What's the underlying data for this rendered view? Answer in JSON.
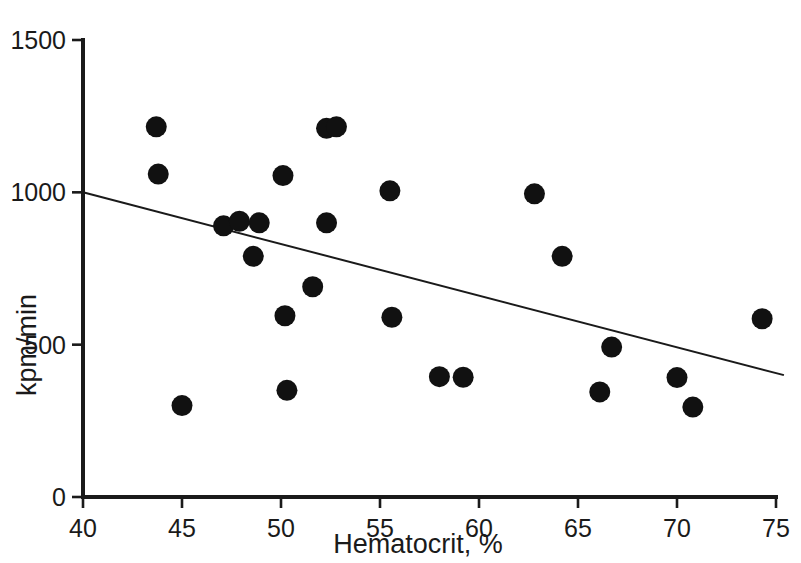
{
  "chart_data": {
    "type": "scatter",
    "title": "",
    "xlabel": "Hematocrit, %",
    "ylabel": "kpm/min",
    "xlim": [
      40,
      75
    ],
    "ylim": [
      0,
      1500
    ],
    "xticks": [
      40,
      45,
      50,
      55,
      60,
      65,
      70,
      75
    ],
    "xtick_labels": [
      "40",
      "45",
      "50",
      "55",
      "60",
      "65",
      "70",
      "75"
    ],
    "yticks": [
      0,
      500,
      1000,
      1500
    ],
    "ytick_labels": [
      "0",
      "500",
      "1000",
      "1500"
    ],
    "grid": false,
    "legend": null,
    "marker": "filled-circle",
    "marker_color": "#111111",
    "points": [
      {
        "x": 43.7,
        "y": 1215
      },
      {
        "x": 43.8,
        "y": 1060
      },
      {
        "x": 45.0,
        "y": 300
      },
      {
        "x": 47.1,
        "y": 890
      },
      {
        "x": 47.9,
        "y": 905
      },
      {
        "x": 48.6,
        "y": 790
      },
      {
        "x": 48.9,
        "y": 900
      },
      {
        "x": 50.1,
        "y": 1055
      },
      {
        "x": 50.2,
        "y": 595
      },
      {
        "x": 50.3,
        "y": 350
      },
      {
        "x": 51.6,
        "y": 690
      },
      {
        "x": 52.3,
        "y": 1210
      },
      {
        "x": 52.8,
        "y": 1215
      },
      {
        "x": 52.3,
        "y": 900
      },
      {
        "x": 55.5,
        "y": 1005
      },
      {
        "x": 55.6,
        "y": 590
      },
      {
        "x": 58.0,
        "y": 395
      },
      {
        "x": 59.2,
        "y": 393
      },
      {
        "x": 62.8,
        "y": 995
      },
      {
        "x": 64.2,
        "y": 790
      },
      {
        "x": 66.1,
        "y": 345
      },
      {
        "x": 66.7,
        "y": 492
      },
      {
        "x": 70.0,
        "y": 392
      },
      {
        "x": 70.8,
        "y": 295
      },
      {
        "x": 74.3,
        "y": 585
      }
    ],
    "fit_line": {
      "name": "regression-line",
      "x_start": 40.0,
      "y_start": 1000,
      "x_end": 75.4,
      "y_end": 400
    }
  }
}
